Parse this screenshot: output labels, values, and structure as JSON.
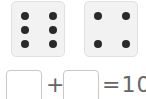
{
  "dice": [
    {
      "value": 6,
      "dots": [
        [
          13,
          14
        ],
        [
          41,
          14
        ],
        [
          13,
          28
        ],
        [
          41,
          28
        ],
        [
          13,
          42
        ],
        [
          41,
          42
        ]
      ]
    },
    {
      "value": 4,
      "dots": [
        [
          13,
          14
        ],
        [
          41,
          14
        ],
        [
          13,
          42
        ],
        [
          41,
          42
        ]
      ]
    }
  ],
  "equation": {
    "plus": "+",
    "equals_text": "=10",
    "box1_value": "",
    "box2_value": ""
  }
}
